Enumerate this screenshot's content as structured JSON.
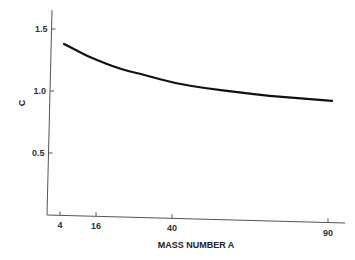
{
  "chart_data": {
    "type": "line",
    "title": "",
    "xlabel": "MASS NUMBER A",
    "ylabel": "C",
    "xticks": [
      4,
      16,
      40,
      90
    ],
    "xtick_labels": [
      "4",
      "16",
      "40",
      "90"
    ],
    "yticks": [
      0.5,
      1.0,
      1.5
    ],
    "ytick_labels": [
      "0.5",
      "1.0",
      "1.5"
    ],
    "ylim": [
      0,
      1.6
    ],
    "xlim": [
      0,
      95
    ],
    "grid": false,
    "legend": null,
    "series": [
      {
        "name": "C",
        "x": [
          4,
          8,
          12,
          16,
          20,
          25,
          30,
          40,
          50,
          60,
          70,
          80,
          90
        ],
        "y": [
          1.38,
          1.33,
          1.28,
          1.24,
          1.2,
          1.16,
          1.13,
          1.06,
          1.02,
          0.99,
          0.96,
          0.94,
          0.92
        ]
      }
    ]
  }
}
